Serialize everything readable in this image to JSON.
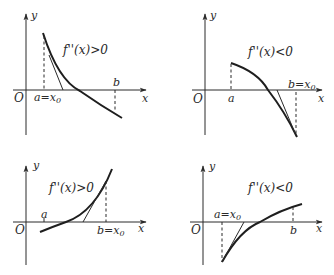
{
  "figure": {
    "panels": [
      {
        "id": "top-left",
        "condition": "f''(x)>0",
        "axis_y": "y",
        "axis_x": "x",
        "origin": "O",
        "label_a": "a=x",
        "label_a_sub": "0",
        "label_b": "b",
        "curve_shape": "decreasing, convex",
        "start_point": "a"
      },
      {
        "id": "top-right",
        "condition": "f''(x)<0",
        "axis_y": "y",
        "axis_x": "x",
        "origin": "O",
        "label_a": "a",
        "label_b": "b=x",
        "label_b_sub": "0",
        "curve_shape": "decreasing, concave",
        "start_point": "b"
      },
      {
        "id": "bottom-left",
        "condition": "f''(x)>0",
        "axis_y": "y",
        "axis_x": "x",
        "origin": "O",
        "label_a": "a",
        "label_b": "b=x",
        "label_b_sub": "0",
        "curve_shape": "increasing, convex",
        "start_point": "b"
      },
      {
        "id": "bottom-right",
        "condition": "f''(x)<0",
        "axis_y": "y",
        "axis_x": "x",
        "origin": "O",
        "label_a": "a=x",
        "label_a_sub": "0",
        "label_b": "b",
        "curve_shape": "increasing, concave",
        "start_point": "a"
      }
    ]
  }
}
